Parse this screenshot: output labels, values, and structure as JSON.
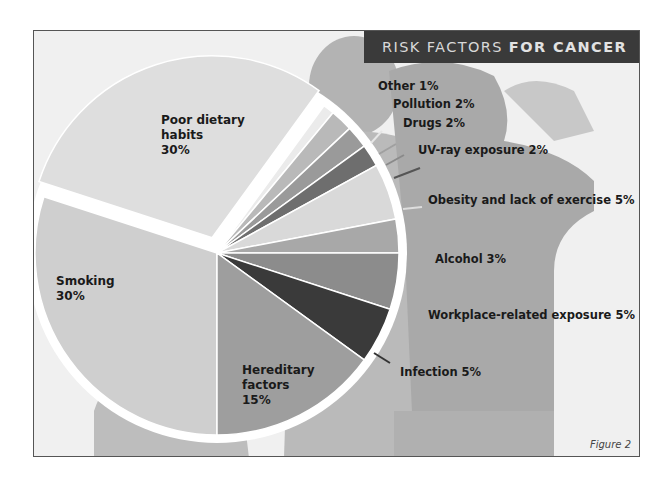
{
  "title": {
    "part1": "RISK FACTORS",
    "part2": "FOR CANCER"
  },
  "caption": "Figure 2",
  "colors": {
    "title_bar": "#3a3a3a",
    "smoking": "#cfcfcf",
    "poor_diet": "#dedede",
    "other": "#ebebeb",
    "pollution": "#b9b9b9",
    "drugs": "#9a9a9a",
    "uv": "#6e6e6e",
    "obesity": "#d9d9d9",
    "alcohol": "#a8a8a8",
    "workplace": "#8c8c8c",
    "infection": "#3a3a3a",
    "hereditary": "#9e9e9e"
  },
  "labels": {
    "poor_diet": {
      "line1": "Poor dietary",
      "line2": "habits",
      "line3": "30%"
    },
    "smoking": {
      "line1": "Smoking",
      "line2": "30%"
    },
    "hereditary": {
      "line1": "Hereditary",
      "line2": "factors",
      "line3": "15%"
    },
    "other": "Other 1%",
    "pollution": "Pollution 2%",
    "drugs": "Drugs 2%",
    "uv": "UV-ray exposure 2%",
    "obesity": "Obesity and lack of exercise 5%",
    "alcohol": "Alcohol 3%",
    "workplace": "Workplace-related exposure 5%",
    "infection": "Infection 5%"
  },
  "chart_data": {
    "type": "pie",
    "title": "Risk Factors for Cancer",
    "categories": [
      "Smoking",
      "Poor dietary habits",
      "Other",
      "Pollution",
      "Drugs",
      "UV-ray exposure",
      "Obesity and lack of exercise",
      "Alcohol",
      "Workplace-related exposure",
      "Infection",
      "Hereditary factors"
    ],
    "values": [
      30,
      30,
      1,
      2,
      2,
      2,
      5,
      3,
      5,
      5,
      15
    ],
    "unit": "%",
    "exploded": [
      "Poor dietary habits"
    ],
    "annotations": [
      "Figure 2"
    ]
  }
}
